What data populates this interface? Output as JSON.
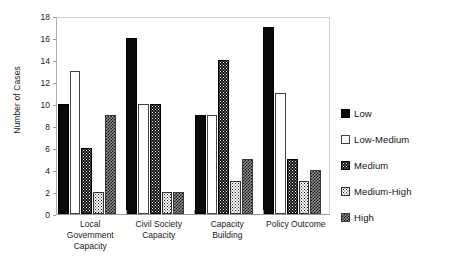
{
  "chart_data": {
    "type": "bar",
    "title": "",
    "subtitle": "",
    "xlabel": "",
    "ylabel": "Number of Cases",
    "ylim": [
      0,
      18
    ],
    "ytick_step": 2,
    "yticks": [
      0,
      2,
      4,
      6,
      8,
      10,
      12,
      14,
      16,
      18
    ],
    "grid": false,
    "legend_position": "right",
    "categories": [
      "Local Government Capacity",
      "Civil Society Capacity",
      "Capacity Building",
      "Policy Outcome"
    ],
    "category_lines": [
      [
        "Local",
        "Government",
        "Capacity"
      ],
      [
        "Civil Society",
        "Capacity"
      ],
      [
        "Capacity",
        "Building"
      ],
      [
        "Policy Outcome"
      ]
    ],
    "series": [
      {
        "name": "Low",
        "pattern": "black-sparse-dots",
        "values": [
          10,
          16,
          9,
          17
        ]
      },
      {
        "name": "Low-Medium",
        "pattern": "white-sparse-dots",
        "values": [
          13,
          10,
          9,
          11
        ]
      },
      {
        "name": "Medium",
        "pattern": "black-dense-dots",
        "values": [
          6,
          10,
          14,
          5
        ]
      },
      {
        "name": "Medium-High",
        "pattern": "white-dense-dots",
        "values": [
          2,
          2,
          3,
          3
        ]
      },
      {
        "name": "High",
        "pattern": "gray-crosshatch",
        "values": [
          9,
          2,
          5,
          4
        ]
      }
    ]
  },
  "legend": {
    "items": [
      {
        "label": "Low"
      },
      {
        "label": "Low-Medium"
      },
      {
        "label": "Medium"
      },
      {
        "label": "Medium-High"
      },
      {
        "label": "High"
      }
    ]
  },
  "colors": {
    "background": "#ffffff",
    "text": "#1a1a1a",
    "axis": "#9a9a9a",
    "frame": "#d0d0d0",
    "high_fill": "#8e8e8e",
    "dark_fill": "#0a0a0a"
  }
}
